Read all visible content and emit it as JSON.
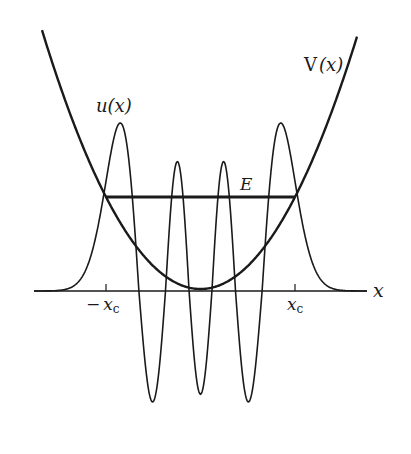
{
  "figure": {
    "labels": {
      "potential": "V(x)",
      "potential_fn": "V",
      "potential_arg": "(x)",
      "wavefunction": "u(x)",
      "wavefunction_fn": "u",
      "wavefunction_arg": "(x)",
      "energy": "E",
      "x_axis": "x",
      "neg_turning_point": "− x",
      "neg_turning_point_minus": "−",
      "turning_point_var": "x",
      "turning_point_sub": "c",
      "pos_turning_point": "x"
    },
    "colors": {
      "ink": "#1a1a1a",
      "background": "#ffffff"
    }
  },
  "chart_data": {
    "type": "line",
    "title": "",
    "xlabel": "x",
    "ylabel": "",
    "grid": false,
    "x_ticks": [
      "-x_c",
      "x_c"
    ],
    "series": [
      {
        "name": "V(x)",
        "kind": "parabola",
        "description": "Harmonic potential V(x) ∝ x², minimum at x=0 slightly above the axis"
      },
      {
        "name": "u(x)",
        "kind": "hermite_function",
        "quantum_number": 6,
        "description": "Oscillatory eigenfunction: 4 positive peaks, 3 negative troughs, decays outside turning points"
      },
      {
        "name": "E",
        "kind": "horizontal_segment",
        "description": "Energy level between classical turning points -x_c and x_c"
      }
    ],
    "annotations": [
      "V(x)",
      "u(x)",
      "E",
      "-x_c",
      "x_c",
      "x"
    ]
  }
}
